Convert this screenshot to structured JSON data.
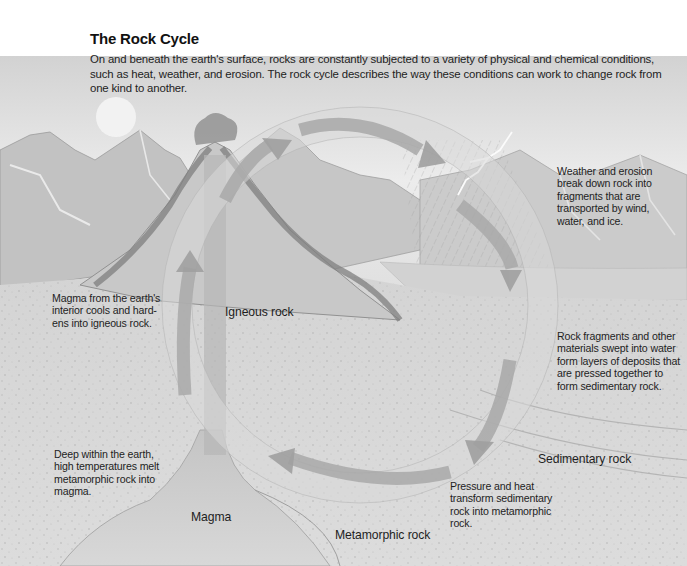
{
  "header": {
    "title": "The Rock Cycle",
    "intro": "On and beneath the earth's surface, rocks are constantly subjected to a variety of physical and chemical conditions, such as heat, weather, and erosion. The rock cycle describes the way these conditions can work to change rock from one kind to another."
  },
  "notes": {
    "weathering": "Weather and erosion break down rock into fragments that are transported by wind, water, and ice.",
    "cooling": "Magma from the earth's interior cools and hard-ens into igneous rock.",
    "deposition": "Rock fragments and other materials swept into water form layers of deposits that are pressed together to form sedimentary rock.",
    "melting": "Deep within the earth, high temperatures melt metamorphic rock into magma.",
    "metamorphism": "Pressure and heat transform sedimentary rock into metamorphic rock."
  },
  "labels": {
    "igneous": "Igneous rock",
    "sedimentary": "Sedimentary rock",
    "metamorphic": "Metamorphic rock",
    "magma": "Magma"
  },
  "cycle_stages": [
    "Igneous rock",
    "Sedimentary rock",
    "Metamorphic rock",
    "Magma"
  ],
  "palette": {
    "sky": "#e6e6e6",
    "mountains": "#b9b9b9",
    "ground": "#d6d6d6",
    "arrow": "#a9a9a9",
    "text": "#1e1e1e"
  }
}
